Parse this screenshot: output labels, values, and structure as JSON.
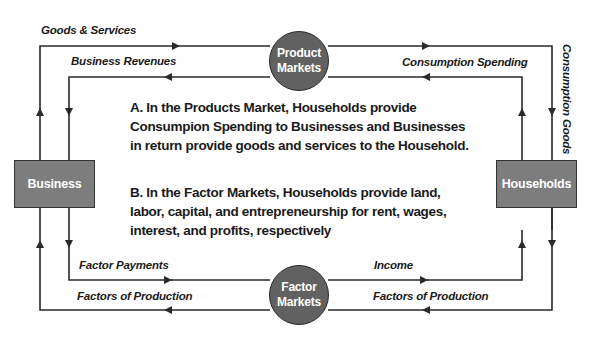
{
  "diagram": {
    "nodes": {
      "business": "Business",
      "households": "Households",
      "product_markets": [
        "Product",
        "Markets"
      ],
      "factor_markets": [
        "Factor",
        "Markets"
      ]
    },
    "flows": {
      "goods_services": "Goods & Services",
      "business_revenues": "Business Revenues",
      "consumption_spending": "Consumption Spending",
      "consumption_goods": "Consumption Goods",
      "factor_payments": "Factor Payments",
      "factors_of_production_left": "Factors of Production",
      "income": "Income",
      "factors_of_production_right": "Factors of Production"
    },
    "explanation": {
      "a": "A. In the Products Market, Households provide Consumpion Spending to Businesses and Businesses in return provide goods and services to the Household.",
      "b": "B. In the Factor Markets, Households provide land, labor, capital, and entrepreneurship for rent, wages, interest, and profits, respectively"
    },
    "colors": {
      "line": "#2a2a2a",
      "box_fill": "#7d7d7d",
      "circle_fill": "#616161",
      "text": "#1a1a1a"
    }
  }
}
